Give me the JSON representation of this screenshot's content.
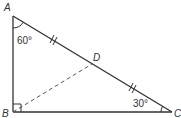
{
  "diagram": {
    "type": "right triangle with median",
    "vertices": {
      "A": {
        "label": "A",
        "x": 13,
        "y": 16
      },
      "B": {
        "label": "B",
        "x": 13,
        "y": 112
      },
      "C": {
        "label": "C",
        "x": 172,
        "y": 112
      },
      "D": {
        "label": "D",
        "x": 92,
        "y": 64
      }
    },
    "angles": {
      "A": "60°",
      "C": "30°",
      "B": "right angle"
    },
    "segments": {
      "solid": [
        "AB",
        "BC",
        "AC"
      ],
      "dashed": [
        "BD"
      ]
    },
    "tick_marks": "AD and DC marked equal (double ticks)",
    "colors": {
      "stroke": "#333333",
      "background": "#ffffff"
    }
  }
}
